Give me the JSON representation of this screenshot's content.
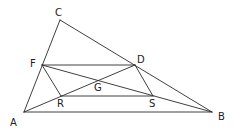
{
  "diagram": {
    "type": "geometry",
    "points": {
      "A": {
        "x": 24,
        "y": 112,
        "label": "A",
        "lx": 10,
        "ly": 126
      },
      "B": {
        "x": 212,
        "y": 112,
        "label": "B",
        "lx": 218,
        "ly": 120
      },
      "C": {
        "x": 60,
        "y": 20,
        "label": "C",
        "lx": 55,
        "ly": 16
      },
      "D": {
        "x": 135,
        "y": 65,
        "label": "D",
        "lx": 137,
        "ly": 63
      },
      "F": {
        "x": 42,
        "y": 65,
        "label": "F",
        "lx": 30,
        "ly": 67
      },
      "R": {
        "x": 61,
        "y": 96,
        "label": "R",
        "lx": 57,
        "ly": 107
      },
      "S": {
        "x": 153,
        "y": 96,
        "label": "S",
        "lx": 149,
        "ly": 107
      },
      "G": {
        "x": 98,
        "y": 82,
        "label": "G",
        "lx": 94,
        "ly": 91
      }
    },
    "segments": [
      [
        "A",
        "B"
      ],
      [
        "A",
        "C"
      ],
      [
        "C",
        "B"
      ],
      [
        "F",
        "D"
      ],
      [
        "R",
        "S"
      ],
      [
        "F",
        "R"
      ],
      [
        "D",
        "S"
      ],
      [
        "F",
        "B"
      ],
      [
        "A",
        "D"
      ]
    ]
  }
}
